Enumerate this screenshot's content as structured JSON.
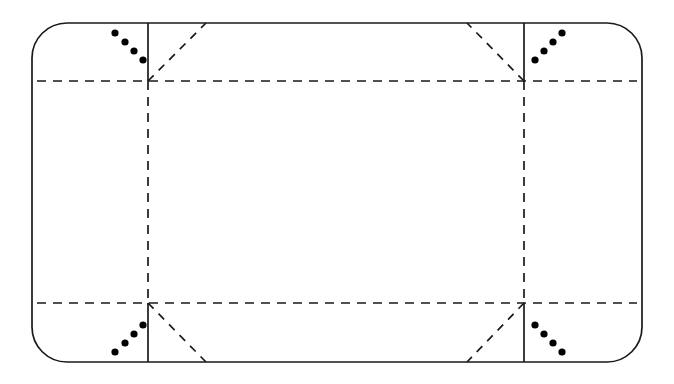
{
  "diagram": {
    "type": "line-diagram",
    "canvas": {
      "width": 674,
      "height": 384
    },
    "colors": {
      "stroke": "#1a1a1a",
      "dot": "#000000",
      "background": "#ffffff"
    },
    "stroke_width": 1.7,
    "dash_pattern_orthogonal": "9 7",
    "dash_pattern_diagonal": "8 7",
    "outline": {
      "name": "rounded-rectangle-outline",
      "left": 32,
      "top": 23,
      "right": 642,
      "bottom": 362,
      "corner_radius": 35,
      "style": "solid"
    },
    "guides": {
      "vertical_left_x": 148,
      "vertical_right_x": 524,
      "horizontal_top_y": 81,
      "horizontal_bottom_y": 303
    },
    "segments": [
      {
        "name": "vertical-left-top-solid",
        "x1": 148,
        "y1": 23,
        "x2": 148,
        "y2": 81,
        "style": "solid"
      },
      {
        "name": "vertical-right-top-solid",
        "x1": 524,
        "y1": 23,
        "x2": 524,
        "y2": 81,
        "style": "solid"
      },
      {
        "name": "vertical-left-bottom-solid",
        "x1": 148,
        "y1": 303,
        "x2": 148,
        "y2": 362,
        "style": "solid"
      },
      {
        "name": "vertical-right-bottom-solid",
        "x1": 524,
        "y1": 303,
        "x2": 524,
        "y2": 362,
        "style": "solid"
      },
      {
        "name": "vertical-left-middle-dashed",
        "x1": 148,
        "y1": 81,
        "x2": 148,
        "y2": 303,
        "style": "dashed"
      },
      {
        "name": "vertical-right-middle-dashed",
        "x1": 524,
        "y1": 81,
        "x2": 524,
        "y2": 303,
        "style": "dashed"
      },
      {
        "name": "horizontal-top-dashed",
        "x1": 37,
        "y1": 81,
        "x2": 637,
        "y2": 81,
        "style": "dashed"
      },
      {
        "name": "horizontal-bottom-dashed",
        "x1": 37,
        "y1": 303,
        "x2": 637,
        "y2": 303,
        "style": "dashed"
      }
    ],
    "diagonals": [
      {
        "name": "diagonal-top-left",
        "x1": 148,
        "y1": 81,
        "x2": 206,
        "y2": 23,
        "style": "dashed"
      },
      {
        "name": "diagonal-top-right",
        "x1": 524,
        "y1": 81,
        "x2": 467,
        "y2": 23,
        "style": "dashed"
      },
      {
        "name": "diagonal-bottom-left",
        "x1": 148,
        "y1": 303,
        "x2": 206,
        "y2": 362,
        "style": "dashed"
      },
      {
        "name": "diagonal-bottom-right",
        "x1": 524,
        "y1": 303,
        "x2": 467,
        "y2": 362,
        "style": "dashed"
      }
    ],
    "dot_groups": [
      {
        "name": "dot-group-top-left",
        "count": 4,
        "radius": 3.6,
        "dots": [
          {
            "cx": 115,
            "cy": 33
          },
          {
            "cx": 125,
            "cy": 42
          },
          {
            "cx": 134,
            "cy": 51
          },
          {
            "cx": 143,
            "cy": 60
          }
        ]
      },
      {
        "name": "dot-group-top-right",
        "count": 4,
        "radius": 3.6,
        "dots": [
          {
            "cx": 535,
            "cy": 60
          },
          {
            "cx": 544,
            "cy": 51
          },
          {
            "cx": 553,
            "cy": 42
          },
          {
            "cx": 562,
            "cy": 33
          }
        ]
      },
      {
        "name": "dot-group-bottom-left",
        "count": 4,
        "radius": 3.6,
        "dots": [
          {
            "cx": 115,
            "cy": 352
          },
          {
            "cx": 125,
            "cy": 343
          },
          {
            "cx": 134,
            "cy": 334
          },
          {
            "cx": 143,
            "cy": 325
          }
        ]
      },
      {
        "name": "dot-group-bottom-right",
        "count": 4,
        "radius": 3.6,
        "dots": [
          {
            "cx": 535,
            "cy": 325
          },
          {
            "cx": 544,
            "cy": 334
          },
          {
            "cx": 553,
            "cy": 343
          },
          {
            "cx": 562,
            "cy": 352
          }
        ]
      }
    ]
  }
}
